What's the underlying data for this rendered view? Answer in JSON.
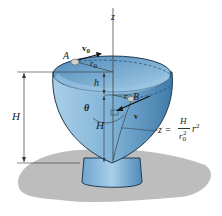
{
  "figure": {
    "labels": {
      "z_axis": "z",
      "point_A": "A",
      "point_B": "B",
      "v0": "v",
      "v0_sub": "0",
      "r0": "r",
      "r0_sub": "0",
      "h": "h",
      "r": "r",
      "theta": "θ",
      "H_left": "H",
      "H_inner": "H",
      "v": "v"
    },
    "equation": {
      "lhs": "z =",
      "numerator": "H",
      "denominator_base": "r",
      "denominator_sub": "0",
      "denominator_sup": "2",
      "rhs_base": "r",
      "rhs_sup": "2"
    },
    "colors": {
      "bowl_outer": "#7fb2d6",
      "bowl_inner": "#9cc6e2",
      "bowl_dark": "#4f89b8",
      "rim": "#b9d9ee",
      "outline": "#1f3b52",
      "shadow": "#bdbdbd",
      "particle": "#cfcfcf"
    }
  }
}
